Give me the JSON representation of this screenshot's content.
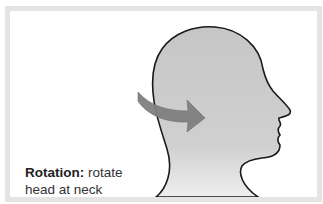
{
  "caption": {
    "term": "Rotation:",
    "line1_rest": " rotate",
    "line2": "head at neck"
  },
  "colors": {
    "frame_border": "#e4e4e4",
    "head_fill_top": "#c8c8c8",
    "head_fill_bottom": "#ececec",
    "outline": "#1a1a1a",
    "arrow": "#7f7f7f"
  }
}
